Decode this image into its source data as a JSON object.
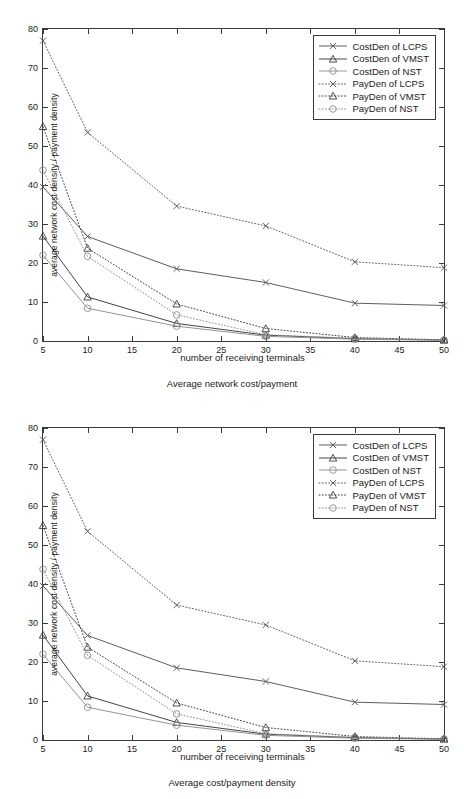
{
  "figures": [
    {
      "caption": "Average network cost/payment",
      "xlabel": "number of receiving terminals",
      "ylabel": "average network cost density / payment density"
    },
    {
      "caption": "Average cost/payment density",
      "xlabel": "number of receiving terminals",
      "ylabel": "average network cost density / payment density"
    }
  ],
  "axis": {
    "xticks": [
      "5",
      "10",
      "15",
      "20",
      "25",
      "30",
      "35",
      "40",
      "45",
      "50"
    ],
    "yticks": [
      "0",
      "10",
      "20",
      "30",
      "40",
      "50",
      "60",
      "70",
      "80"
    ]
  },
  "legend": {
    "items": [
      {
        "label": "CostDen of LCPS",
        "marker": "cross-marker",
        "style": "solid"
      },
      {
        "label": "CostDen of VMST",
        "marker": "triangle-marker",
        "style": "solid"
      },
      {
        "label": "CostDen of NST",
        "marker": "circle-marker",
        "style": "solid"
      },
      {
        "label": "PayDen of LCPS",
        "marker": "cross-marker",
        "style": "dotted"
      },
      {
        "label": "PayDen of VMST",
        "marker": "triangle-marker",
        "style": "dotted"
      },
      {
        "label": "PayDen of NST",
        "marker": "circle-marker",
        "style": "dotted"
      }
    ]
  },
  "chart_data": {
    "type": "line",
    "title": "",
    "xlabel": "number of receiving terminals",
    "ylabel": "average network cost density / payment density",
    "x": [
      5,
      10,
      20,
      30,
      40,
      50
    ],
    "xlim": [
      5,
      50
    ],
    "ylim": [
      0,
      80
    ],
    "xtick_step": 5,
    "ytick_step": 10,
    "grid": false,
    "legend_position": "top-right",
    "series": [
      {
        "name": "CostDen of LCPS",
        "style": "solid",
        "marker": "x",
        "color": "#555555",
        "values": [
          39.5,
          26.8,
          18.5,
          15.0,
          9.7,
          9.1
        ]
      },
      {
        "name": "CostDen of VMST",
        "style": "solid",
        "marker": "triangle",
        "color": "#3a3a3a",
        "values": [
          26.9,
          11.3,
          4.5,
          1.5,
          0.6,
          0.25
        ]
      },
      {
        "name": "CostDen of NST",
        "style": "solid",
        "marker": "circle",
        "color": "#8e8e8e",
        "values": [
          22.0,
          8.4,
          3.8,
          1.2,
          0.45,
          0.2
        ]
      },
      {
        "name": "PayDen of LCPS",
        "style": "dotted",
        "marker": "x",
        "color": "#555555",
        "values": [
          77.0,
          53.5,
          34.6,
          29.5,
          20.3,
          18.8
        ]
      },
      {
        "name": "PayDen of VMST",
        "style": "dotted",
        "marker": "triangle",
        "color": "#3a3a3a",
        "values": [
          55.0,
          23.8,
          9.5,
          3.2,
          0.9,
          0.3
        ]
      },
      {
        "name": "PayDen of NST",
        "style": "dotted",
        "marker": "circle",
        "color": "#8e8e8e",
        "values": [
          43.8,
          21.7,
          6.7,
          1.6,
          0.7,
          0.25
        ]
      }
    ]
  }
}
